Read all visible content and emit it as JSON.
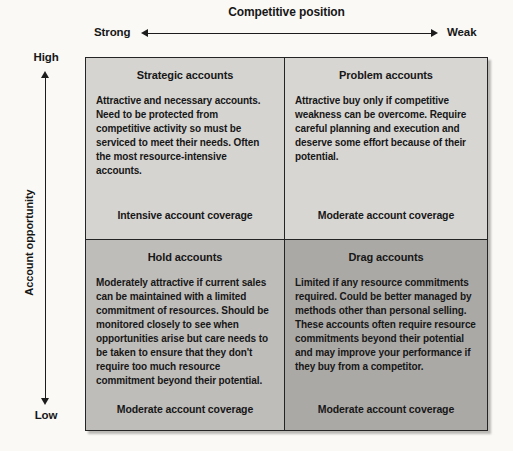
{
  "x_axis": {
    "title": "Competitive position",
    "left_label": "Strong",
    "right_label": "Weak"
  },
  "y_axis": {
    "title": "Account opportunity",
    "top_label": "High",
    "bottom_label": "Low"
  },
  "matrix": {
    "border_color": "#242424",
    "quadrants": {
      "strategic": {
        "title": "Strategic accounts",
        "body": "Attractive and necessary accounts. Need to be protected from competitive activity so must be serviced to meet their needs. Often the most resource-intensive accounts.",
        "footer": "Intensive account coverage",
        "bg": "#d6d4d1"
      },
      "problem": {
        "title": "Problem accounts",
        "body": "Attractive buy only if competitive weakness can be overcome. Require careful planning and execution and deserve some effort because of their potential.",
        "footer": "Moderate account coverage",
        "bg": "#d8d6d3"
      },
      "hold": {
        "title": "Hold accounts",
        "body": "Moderately attractive if current sales can be maintained with a limited commitment of resources. Should be monitored closely to see when opportunities arise but care needs to be taken to ensure that they don't require too much resource commitment beyond their potential.",
        "footer": "Moderate account coverage",
        "bg": "#bfbdba"
      },
      "drag": {
        "title": "Drag accounts",
        "body": "Limited if any resource commitments required. Could be better managed by methods other than personal selling. These accounts often require resource commitments beyond their potential and may improve your performance if they buy from a competitor.",
        "footer": "Moderate account coverage",
        "bg": "#aba9a6"
      }
    }
  }
}
